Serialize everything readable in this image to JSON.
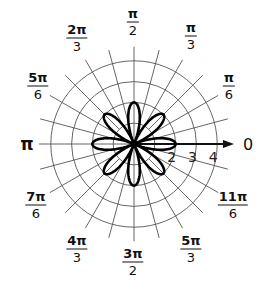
{
  "chart_data": {
    "type": "polar",
    "title": "",
    "equation": "r = 2cos(4θ)",
    "curve": {
      "amplitude": 2,
      "frequency": 4,
      "function": "cos",
      "petals": 8,
      "petal_angles_deg": [
        0,
        45,
        90,
        135,
        180,
        225,
        270,
        315
      ]
    },
    "radial_ticks": [
      1,
      2,
      3,
      4
    ],
    "radial_tick_labels": [
      "2",
      "3",
      "4"
    ],
    "rmax": 4,
    "angular_grid_step_deg": 15,
    "polar_axis_label": "0",
    "angle_labels": [
      {
        "id": "a0",
        "text": "0",
        "num": "0",
        "den": "",
        "x": 248,
        "y": 144
      },
      {
        "id": "a30",
        "text": "π/6",
        "num": "π",
        "den": "6",
        "x": 229,
        "y": 86
      },
      {
        "id": "a60",
        "text": "π/3",
        "num": "π",
        "den": "3",
        "x": 191,
        "y": 36
      },
      {
        "id": "a90",
        "text": "π/2",
        "num": "π",
        "den": "2",
        "x": 133,
        "y": 22
      },
      {
        "id": "a120",
        "text": "2π/3",
        "num": "2π",
        "den": "3",
        "x": 77,
        "y": 38
      },
      {
        "id": "a150",
        "text": "5π/6",
        "num": "5π",
        "den": "6",
        "x": 38,
        "y": 86
      },
      {
        "id": "a180",
        "text": "π",
        "num": "π",
        "den": "",
        "x": 27,
        "y": 144
      },
      {
        "id": "a210",
        "text": "7π/6",
        "num": "7π",
        "den": "6",
        "x": 36,
        "y": 205
      },
      {
        "id": "a240",
        "text": "4π/3",
        "num": "4π",
        "den": "3",
        "x": 77,
        "y": 249
      },
      {
        "id": "a270",
        "text": "3π/2",
        "num": "3π",
        "den": "2",
        "x": 133,
        "y": 262
      },
      {
        "id": "a300",
        "text": "5π/3",
        "num": "5π",
        "den": "3",
        "x": 191,
        "y": 249
      },
      {
        "id": "a330",
        "text": "11π/6",
        "num": "11π",
        "den": "6",
        "x": 233,
        "y": 205
      }
    ],
    "center": {
      "x": 134,
      "y": 144
    },
    "unit_px": 20.8
  },
  "colors": {
    "grid": "#555555",
    "curve": "#000000",
    "axis": "#111111",
    "background": "#ffffff"
  }
}
